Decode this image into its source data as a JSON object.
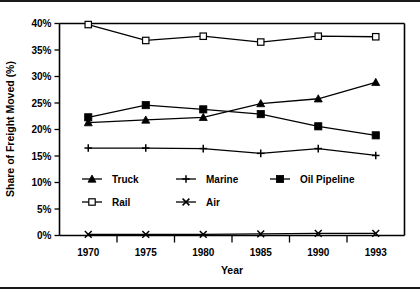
{
  "chart_data": {
    "type": "line",
    "title": "",
    "xlabel": "Year",
    "ylabel": "Share of Freight Moved (%)",
    "categories": [
      "1970",
      "1975",
      "1980",
      "1985",
      "1990",
      "1993"
    ],
    "x": [
      1970,
      1975,
      1980,
      1985,
      1990,
      1993
    ],
    "ylim": [
      0,
      40
    ],
    "yticks": [
      "0%",
      "5%",
      "10%",
      "15%",
      "20%",
      "25%",
      "30%",
      "35%",
      "40%"
    ],
    "ytick_values": [
      0,
      5,
      10,
      15,
      20,
      25,
      30,
      35,
      40
    ],
    "grid": false,
    "legend_position": "inside-lower-center",
    "series": [
      {
        "name": "Truck",
        "marker": "filled-triangle",
        "values": [
          21.3,
          21.8,
          22.3,
          24.9,
          25.8,
          28.9
        ]
      },
      {
        "name": "Marine",
        "marker": "plus",
        "values": [
          16.5,
          16.5,
          16.4,
          15.5,
          16.4,
          15.1
        ]
      },
      {
        "name": "Oil Pipeline",
        "marker": "filled-square",
        "values": [
          22.3,
          24.6,
          23.8,
          22.9,
          20.6,
          18.9
        ]
      },
      {
        "name": "Rail",
        "marker": "open-square",
        "values": [
          39.8,
          36.8,
          37.6,
          36.5,
          37.6,
          37.5
        ]
      },
      {
        "name": "Air",
        "marker": "x-cross",
        "values": [
          0.2,
          0.2,
          0.2,
          0.3,
          0.4,
          0.4
        ]
      }
    ]
  },
  "legend": {
    "entries": [
      {
        "label": "Truck",
        "marker": "filled-triangle"
      },
      {
        "label": "Marine",
        "marker": "plus"
      },
      {
        "label": "Oil Pipeline",
        "marker": "filled-square"
      },
      {
        "label": "Rail",
        "marker": "open-square"
      },
      {
        "label": "Air",
        "marker": "x-cross"
      }
    ]
  },
  "colors": {
    "ink": "#000000",
    "background": "#ffffff",
    "frame": "#1a1a1a"
  }
}
